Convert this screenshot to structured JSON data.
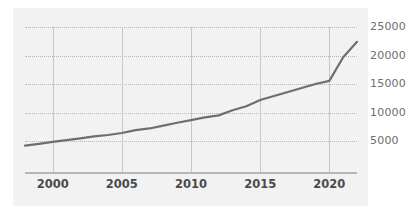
{
  "chart_data": {
    "type": "line",
    "title": "",
    "subtitle": "",
    "xlabel": "",
    "ylabel": "",
    "grid": true,
    "legend_position": "none",
    "xlim": [
      1998,
      2022
    ],
    "ylim": [
      3000,
      25800
    ],
    "x_ticks": [
      2000,
      2005,
      2010,
      2015,
      2020
    ],
    "x_tick_labels": [
      "2000",
      "2005",
      "2010",
      "2015",
      "2020"
    ],
    "y_ticks": [
      5000,
      10000,
      15000,
      20000,
      25000
    ],
    "y_tick_labels": [
      "5000",
      "10000",
      "15000",
      "20000",
      "25000"
    ],
    "series": [
      {
        "name": "value",
        "color": "#6e6e6e",
        "x": [
          1998,
          1999,
          2000,
          2001,
          2002,
          2003,
          2004,
          2005,
          2006,
          2007,
          2008,
          2009,
          2010,
          2011,
          2012,
          2013,
          2014,
          2015,
          2016,
          2017,
          2018,
          2019,
          2020,
          2021,
          2022
        ],
        "values": [
          4200,
          4500,
          4850,
          5150,
          5450,
          5800,
          6050,
          6400,
          6900,
          7200,
          7700,
          8200,
          8650,
          9150,
          9500,
          10400,
          11100,
          12200,
          12900,
          13600,
          14300,
          15000,
          15550,
          19700,
          22400
        ]
      }
    ],
    "colors": {
      "panel_background": "#f2f2f2",
      "page_background": "#ffffff",
      "line": "#6e6e6e",
      "horizontal_gridline": "#b7b7b7",
      "vertical_gridline": "#c6c6c6",
      "axis_line": "#b5b5b5",
      "y_tick_text": "#6e6e6e",
      "x_tick_text": "#4a4a4a"
    }
  }
}
